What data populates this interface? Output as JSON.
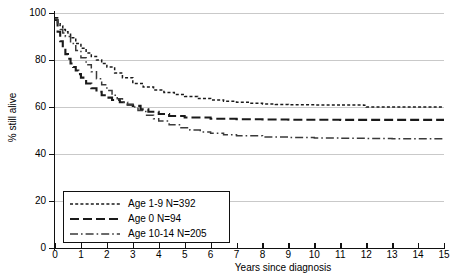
{
  "chart_data": {
    "type": "line",
    "title": "",
    "xlabel": "Years since diagnosis",
    "ylabel": "% still alive",
    "xlim": [
      0,
      15
    ],
    "ylim": [
      0,
      100
    ],
    "xticks": [
      0,
      1,
      2,
      3,
      4,
      5,
      6,
      7,
      8,
      9,
      10,
      11,
      12,
      13,
      14,
      15
    ],
    "yticks": [
      0,
      20,
      40,
      60,
      80,
      100
    ],
    "grid": "horizontal",
    "legend_position": "bottom-left",
    "series": [
      {
        "name": "Age 1-9 N=392",
        "label": "Age 1-9 N=392",
        "style": "short-dash",
        "color": "#1a1a1a",
        "n": 392,
        "plateau": 60,
        "x": [
          0,
          0.1,
          0.2,
          0.3,
          0.4,
          0.5,
          0.6,
          0.8,
          1.0,
          1.2,
          1.4,
          1.6,
          1.8,
          2.0,
          2.3,
          2.6,
          3.0,
          3.4,
          3.8,
          4.2,
          4.6,
          5.0,
          5.5,
          6.0,
          6.5,
          7.0,
          7.5,
          8.0,
          8.5,
          9.0,
          10.0,
          11.0,
          11.9,
          12.0,
          13.0,
          14.0,
          15.0
        ],
        "y": [
          98,
          96,
          94.5,
          93,
          92,
          91,
          89.5,
          87,
          85,
          83,
          81.5,
          80,
          78.5,
          77,
          74.5,
          72.5,
          70,
          68.5,
          67.2,
          66.2,
          65.3,
          64.5,
          63.6,
          63.0,
          62.4,
          62.0,
          61.6,
          61.3,
          61.1,
          61.0,
          60.9,
          60.8,
          60.7,
          60.0,
          60.0,
          60.0,
          60.0
        ]
      },
      {
        "name": "Age 0 N=94",
        "label": "Age 0 N=94",
        "style": "long-dash",
        "color": "#1a1a1a",
        "n": 94,
        "plateau": 54.5,
        "x": [
          0,
          0.1,
          0.2,
          0.3,
          0.4,
          0.5,
          0.6,
          0.7,
          0.8,
          0.9,
          1.0,
          1.2,
          1.4,
          1.6,
          1.8,
          2.0,
          2.2,
          2.5,
          2.8,
          3.0,
          3.3,
          3.6,
          4.0,
          4.4,
          5.0,
          6.0,
          7.0,
          8.0,
          9.0,
          10.0,
          11.0,
          12.0,
          13.0,
          14.0,
          15.0
        ],
        "y": [
          97,
          92,
          88,
          85,
          82.5,
          80.5,
          78.5,
          77,
          75.5,
          74,
          72.5,
          70,
          68,
          66.5,
          65,
          64,
          63,
          62,
          61,
          60.5,
          59,
          58,
          57,
          56.2,
          55.5,
          55.0,
          54.8,
          54.7,
          54.6,
          54.6,
          54.5,
          54.5,
          54.5,
          54.5,
          54.5
        ]
      },
      {
        "name": "Age 10-14 N=205",
        "label": "Age 10-14 N=205",
        "style": "dash-dot",
        "color": "#3a3a3a",
        "n": 205,
        "plateau": 46.5,
        "x": [
          0,
          0.1,
          0.2,
          0.3,
          0.4,
          0.6,
          0.8,
          1.0,
          1.2,
          1.4,
          1.6,
          1.8,
          2.0,
          2.2,
          2.4,
          2.6,
          2.8,
          3.0,
          3.2,
          3.5,
          3.8,
          4.0,
          4.4,
          4.8,
          5.2,
          5.6,
          6.0,
          6.5,
          7.0,
          8.0,
          9.0,
          10.0,
          11.0,
          12.0,
          13.0,
          14.0,
          15.0
        ],
        "y": [
          97.5,
          95,
          93,
          91.5,
          90,
          87,
          84,
          81,
          78,
          75,
          72,
          69.5,
          67,
          65,
          63.5,
          62,
          61,
          60,
          58.5,
          56.5,
          55,
          54,
          52.5,
          51.2,
          50.2,
          49.4,
          48.8,
          48.2,
          47.8,
          47.2,
          47.0,
          46.8,
          46.7,
          46.6,
          46.5,
          46.5,
          46.5
        ]
      }
    ]
  }
}
